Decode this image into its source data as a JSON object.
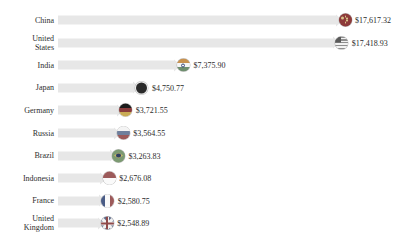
{
  "chart_data": {
    "type": "bar",
    "orientation": "horizontal",
    "title": "",
    "subtitle": "",
    "xlabel": "",
    "ylabel": "",
    "grid": false,
    "legend": false,
    "axis_visible": false,
    "value_prefix": "$",
    "xlim": [
      0,
      17617.32
    ],
    "categories": [
      "China",
      "United States",
      "India",
      "Japan",
      "Germany",
      "Russia",
      "Brazil",
      "Indonesia",
      "France",
      "United Kingdom"
    ],
    "values": [
      17617.32,
      17418.93,
      7375.9,
      4750.77,
      3721.55,
      3564.55,
      3263.83,
      2676.08,
      2580.75,
      2548.89
    ],
    "value_labels": [
      "$17,617.32",
      "$17,418.93",
      "$7,375.90",
      "$4,750.77",
      "$3,721.55",
      "$3,564.55",
      "$3,263.83",
      "$2,676.08",
      "$2,580.75",
      "$2,548.89"
    ],
    "bar_color": "#e7e7e7",
    "text_color": "#2b2b2b"
  },
  "rows": [
    {
      "label": "China",
      "value_label": "$17,617.32",
      "flag": "flag-china-icon"
    },
    {
      "label": "United\nStates",
      "value_label": "$17,418.93",
      "flag": "flag-united-states-icon"
    },
    {
      "label": "India",
      "value_label": "$7,375.90",
      "flag": "flag-india-icon"
    },
    {
      "label": "Japan",
      "value_label": "$4,750.77",
      "flag": "flag-japan-icon"
    },
    {
      "label": "Germany",
      "value_label": "$3,721.55",
      "flag": "flag-germany-icon"
    },
    {
      "label": "Russia",
      "value_label": "$3,564.55",
      "flag": "flag-russia-icon"
    },
    {
      "label": "Brazil",
      "value_label": "$3,263.83",
      "flag": "flag-brazil-icon"
    },
    {
      "label": "Indonesia",
      "value_label": "$2,676.08",
      "flag": "flag-indonesia-icon"
    },
    {
      "label": "France",
      "value_label": "$2,580.75",
      "flag": "flag-france-icon"
    },
    {
      "label": "United\nKingdom",
      "value_label": "$2,548.89",
      "flag": "flag-united-kingdom-icon"
    }
  ]
}
